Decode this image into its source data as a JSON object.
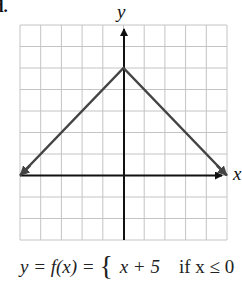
{
  "figure": {
    "label": "d.",
    "x_axis_label": "x",
    "y_axis_label": "y",
    "formula": {
      "lhs": "y = f(x) =",
      "case1_expr": "x + 5",
      "case1_cond": "if x ≤ 0"
    }
  },
  "chart_data": {
    "type": "line",
    "title": "",
    "xlabel": "x",
    "ylabel": "y",
    "xlim": [
      -5,
      5
    ],
    "ylim": [
      -3,
      7
    ],
    "grid": true,
    "series": [
      {
        "name": "f(x)",
        "x": [
          -5,
          0,
          5
        ],
        "y": [
          0,
          5,
          0
        ],
        "arrows_at_ends": true
      }
    ],
    "piecewise": [
      {
        "expr": "x + 5",
        "condition": "x ≤ 0"
      }
    ],
    "colors": {
      "grid": "#bdbdbd",
      "axis": "#111111",
      "line": "#444444"
    }
  }
}
